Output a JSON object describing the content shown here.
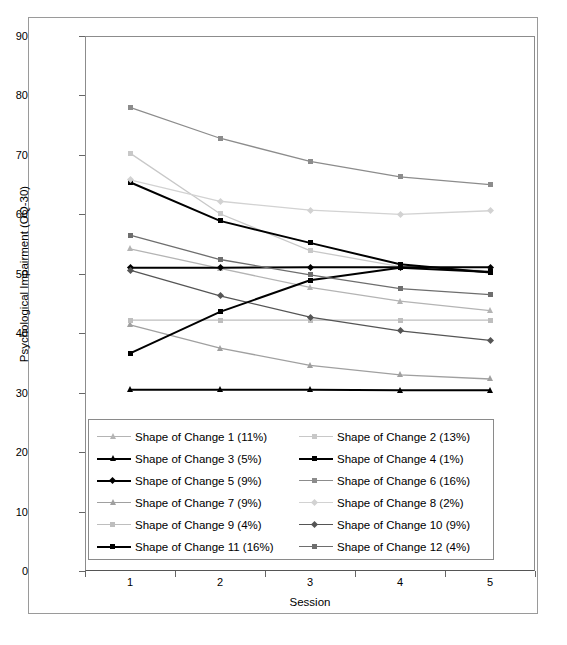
{
  "chart_data": {
    "type": "line",
    "title": "",
    "xlabel": "Session",
    "ylabel": "Psychological Impairment (OQ-30)",
    "x": [
      1,
      2,
      3,
      4,
      5
    ],
    "xtick_labels": [
      "1",
      "2",
      "3",
      "4",
      "5"
    ],
    "ytick_labels": [
      "0",
      "10",
      "20",
      "30",
      "40",
      "50",
      "60",
      "70",
      "80",
      "90"
    ],
    "yticks": [
      0,
      10,
      20,
      30,
      40,
      50,
      60,
      70,
      80,
      90
    ],
    "ylim": [
      0,
      90
    ],
    "xlim": [
      0.5,
      5.5
    ],
    "grid": false,
    "legend_position": "inside-lower-center",
    "series": [
      {
        "name": "Shape of Change 1 (11%)",
        "percent": "11%",
        "values": [
          54.2,
          50.9,
          47.7,
          45.4,
          43.8
        ],
        "color": "#b4b4b4",
        "marker": "triangle"
      },
      {
        "name": "Shape of Change 2 (13%)",
        "percent": "13%",
        "values": [
          70.3,
          60.1,
          53.9,
          51.2,
          50.5
        ],
        "color": "#c8c8c8",
        "marker": "square"
      },
      {
        "name": "Shape of Change 3 (5%)",
        "percent": "5%",
        "values": [
          30.5,
          30.5,
          30.5,
          30.4,
          30.4
        ],
        "color": "#000000",
        "marker": "triangle"
      },
      {
        "name": "Shape of Change 4 (1%)",
        "percent": "1%",
        "values": [
          65.4,
          58.9,
          55.2,
          51.6,
          50.2
        ],
        "color": "#000000",
        "marker": "square"
      },
      {
        "name": "Shape of Change 5 (9%)",
        "percent": "9%",
        "values": [
          51.0,
          51.0,
          51.1,
          51.1,
          51.1
        ],
        "color": "#000000",
        "marker": "diamond"
      },
      {
        "name": "Shape of Change 6 (16%)",
        "percent": "16%",
        "values": [
          78.0,
          72.8,
          68.9,
          66.3,
          65.0
        ],
        "color": "#8c8c8c",
        "marker": "square"
      },
      {
        "name": "Shape of Change 7 (9%)",
        "percent": "9%",
        "values": [
          41.4,
          37.5,
          34.6,
          33.0,
          32.3
        ],
        "color": "#a0a0a0",
        "marker": "triangle"
      },
      {
        "name": "Shape of Change 8 (2%)",
        "percent": "2%",
        "values": [
          65.8,
          62.2,
          60.7,
          60.0,
          60.6
        ],
        "color": "#d2d2d2",
        "marker": "diamond"
      },
      {
        "name": "Shape of Change 9 (4%)",
        "percent": "4%",
        "values": [
          42.2,
          42.2,
          42.2,
          42.2,
          42.2
        ],
        "color": "#bebebe",
        "marker": "square"
      },
      {
        "name": "Shape of Change 10 (9%)",
        "percent": "9%",
        "values": [
          50.6,
          46.3,
          42.7,
          40.4,
          38.8
        ],
        "color": "#555555",
        "marker": "diamond"
      },
      {
        "name": "Shape of Change 11 (16%)",
        "percent": "16%",
        "values": [
          36.6,
          43.6,
          48.9,
          51.0,
          50.3
        ],
        "color": "#000000",
        "marker": "square"
      },
      {
        "name": "Shape of Change 12 (4%)",
        "percent": "4%",
        "values": [
          56.5,
          52.4,
          49.8,
          47.5,
          46.5
        ],
        "color": "#6e6e6e",
        "marker": "square"
      }
    ]
  }
}
